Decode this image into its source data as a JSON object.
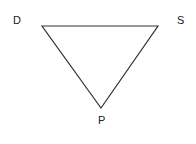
{
  "diagram": {
    "type": "triangle",
    "vertices": [
      {
        "label": "D",
        "x": 42,
        "y": 26
      },
      {
        "label": "S",
        "x": 158,
        "y": 26
      },
      {
        "label": "P",
        "x": 101,
        "y": 108
      }
    ],
    "stroke_color": "#333333"
  },
  "labels": {
    "d": "D",
    "s": "S",
    "p": "P"
  }
}
